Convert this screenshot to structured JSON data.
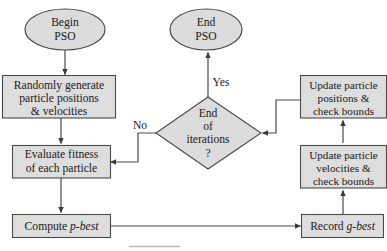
{
  "diagram": {
    "colors": {
      "node_fill": "#dedede",
      "node_stroke": "#4a4a4a",
      "edge_stroke": "#4a4a4a",
      "text": "#1a1a1a",
      "background": "#ffffff"
    },
    "nodes": [
      {
        "id": "begin-pso",
        "shape": "ellipse",
        "lines": [
          "Begin",
          "PSO"
        ]
      },
      {
        "id": "end-pso",
        "shape": "ellipse",
        "lines": [
          "End",
          "PSO"
        ]
      },
      {
        "id": "randomly-generate",
        "shape": "rectangle",
        "lines": [
          "Randomly generate",
          "particle positions",
          "& velocities"
        ]
      },
      {
        "id": "update-positions",
        "shape": "rectangle",
        "lines": [
          "Update particle",
          "positions &",
          "check bounds"
        ]
      },
      {
        "id": "end-of-iterations",
        "shape": "diamond",
        "lines": [
          "End",
          "of",
          "iterations",
          "?"
        ]
      },
      {
        "id": "evaluate-fitness",
        "shape": "rectangle",
        "lines": [
          "Evaluate fitness",
          "of each particle"
        ]
      },
      {
        "id": "update-velocities",
        "shape": "rectangle",
        "lines": [
          "Update particle",
          "velocities &",
          "check bounds"
        ]
      },
      {
        "id": "compute-p-best",
        "shape": "rectangle",
        "text_plain": "Compute ",
        "text_italic": "p-best"
      },
      {
        "id": "record-g-best",
        "shape": "rectangle",
        "text_plain": "Record ",
        "text_italic": "g-best"
      }
    ],
    "edge_labels": {
      "no": "No",
      "yes": "Yes"
    }
  }
}
